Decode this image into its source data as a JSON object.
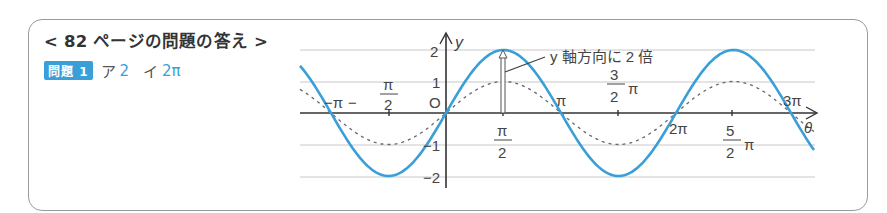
{
  "header": {
    "title": "< 82 ページの問題の答え >"
  },
  "answer": {
    "badge": "問題 1",
    "items": [
      {
        "label": "ア",
        "value": "2"
      },
      {
        "label": "イ",
        "value": "2π"
      }
    ]
  },
  "annotation": "y 軸方向に 2 倍",
  "colors": {
    "accent": "#3a9fd8",
    "dashed": "#666666",
    "grid": "#c8c8c8"
  },
  "chart_data": {
    "type": "line",
    "title": "",
    "xlabel": "θ",
    "ylabel": "y",
    "x_ticks": [
      "−π",
      "−π/2",
      "O",
      "π/2",
      "π",
      "3/2 π",
      "2π",
      "5/2 π",
      "3π"
    ],
    "y_ticks": [
      "2",
      "1",
      "O",
      "−1",
      "−2"
    ],
    "xlim": [
      "-1.27π",
      "3.2π"
    ],
    "ylim": [
      -2,
      2
    ],
    "grid": "horizontal at y = ±1, ±2",
    "series": [
      {
        "name": "y = 2 sin θ",
        "style": "solid",
        "color": "#3a9fd8",
        "amplitude": 2,
        "period": "2π"
      },
      {
        "name": "y = sin θ",
        "style": "dashed",
        "color": "#666666",
        "amplitude": 1,
        "period": "2π"
      }
    ],
    "annotation": "y 軸方向に 2 倍 (arrow from y=1 to y=2 at θ=π/2)"
  }
}
